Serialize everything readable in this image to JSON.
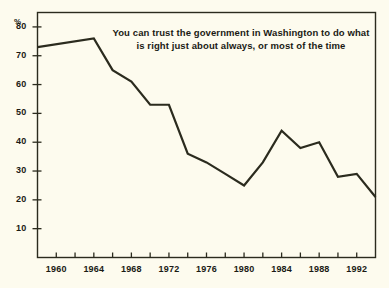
{
  "chart_data": {
    "type": "line",
    "title": "",
    "annotation": "You can trust the government in Washington to do what is right just about always, or most of the time",
    "annotation_line1": "You can trust the government in Washington to do what",
    "annotation_line2": "is right just about always, or most of the time",
    "xlabel": "",
    "ylabel": "%",
    "ylim": [
      0,
      85
    ],
    "xlim": [
      1958,
      1994
    ],
    "grid": false,
    "legend": false,
    "line_color": "#2b2b1e",
    "background_color": "#fdfbee",
    "y_ticks": [
      10,
      20,
      30,
      40,
      50,
      60,
      70,
      80
    ],
    "y_tick_labels": [
      "10",
      "20",
      "30",
      "40",
      "50",
      "60",
      "70",
      "80"
    ],
    "x_ticks": [
      1960,
      1962,
      1964,
      1966,
      1968,
      1970,
      1972,
      1974,
      1976,
      1978,
      1980,
      1982,
      1984,
      1986,
      1988,
      1990,
      1992
    ],
    "x_tick_labels": [
      "1960",
      "",
      "1964",
      "",
      "1968",
      "",
      "1972",
      "",
      "1976",
      "",
      "1980",
      "",
      "1984",
      "",
      "1988",
      "",
      "1992"
    ],
    "x_labeled_ticks": [
      "1960",
      "1964",
      "1968",
      "1972",
      "1976",
      "1980",
      "1984",
      "1988",
      "1992"
    ],
    "x": [
      1958,
      1964,
      1966,
      1968,
      1970,
      1972,
      1974,
      1976,
      1978,
      1980,
      1982,
      1984,
      1986,
      1988,
      1990,
      1992,
      1994
    ],
    "values": [
      73,
      76,
      65,
      61,
      53,
      53,
      36,
      33,
      29,
      25,
      33,
      44,
      38,
      40,
      28,
      29,
      21
    ],
    "series": [
      {
        "name": "Trust in government",
        "x": [
          1958,
          1964,
          1966,
          1968,
          1970,
          1972,
          1974,
          1976,
          1978,
          1980,
          1982,
          1984,
          1986,
          1988,
          1990,
          1992,
          1994
        ],
        "values": [
          73,
          76,
          65,
          61,
          53,
          53,
          36,
          33,
          29,
          25,
          33,
          44,
          38,
          40,
          28,
          29,
          21
        ]
      }
    ]
  }
}
